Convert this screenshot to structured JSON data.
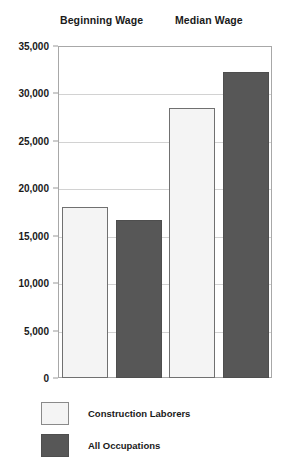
{
  "chart_data": {
    "type": "bar",
    "title": "",
    "xlabel": "",
    "ylabel": "",
    "categories": [
      "Beginning Wage",
      "Median Wage"
    ],
    "series": [
      {
        "name": "Construction Laborers",
        "values": [
          18000,
          28500
        ],
        "color": "#f4f4f4"
      },
      {
        "name": "All Occupations",
        "values": [
          16700,
          32300
        ],
        "color": "#575757"
      }
    ],
    "ylim": [
      0,
      35000
    ],
    "ytick_values": [
      0,
      5000,
      10000,
      15000,
      20000,
      25000,
      30000,
      35000
    ],
    "ytick_labels": [
      "0",
      "5,000",
      "10,000",
      "15,000",
      "20,000",
      "25,000",
      "30,000",
      "35,000"
    ],
    "grid": true,
    "grid_axis": "y",
    "legend_position": "bottom-left"
  },
  "colors": {
    "light_bar": "#f4f4f4",
    "dark_bar": "#575757",
    "frame": "#a8a8a8",
    "gridline": "#d2d2d2",
    "text": "#1a1a1a"
  }
}
